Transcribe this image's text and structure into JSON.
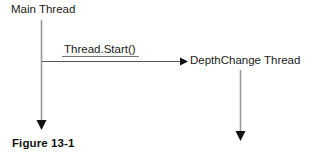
{
  "figure": {
    "caption": "Figure 13-1",
    "background_color": "#ffffff",
    "text_color": "#1a1a1a",
    "lifeline_color": "#9a9a9a",
    "arrow_color": "#111111",
    "message_line_color": "#555555"
  },
  "diagram": {
    "type": "sequence-diagram",
    "participants": [
      {
        "id": "main-thread",
        "label": "Main Thread",
        "label_x": 11,
        "label_y": 4,
        "lifeline_x": 41,
        "lifeline_top": 20,
        "lifeline_bottom": 129
      },
      {
        "id": "depthchange-thread",
        "label": "DepthChange Thread",
        "label_x": 190,
        "label_y": 55,
        "lifeline_x": 240,
        "lifeline_top": 70,
        "lifeline_bottom": 141
      }
    ],
    "messages": [
      {
        "id": "thread-start",
        "label": "Thread.Start()",
        "from": "main-thread",
        "to": "depthchange-thread",
        "line_y": 61,
        "line_x_start": 42,
        "line_x_end": 187,
        "underline_x_start": 60,
        "underline_x_end": 140,
        "label_x": 64,
        "label_y": 44
      }
    ]
  }
}
